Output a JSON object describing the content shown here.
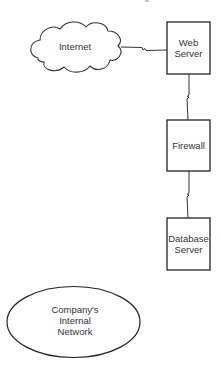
{
  "diagram": {
    "type": "network-topology",
    "stroke_color": "#333333",
    "background": "#ffffff",
    "nodes": [
      {
        "id": "internet",
        "shape": "cloud",
        "label": "Internet",
        "x": 30,
        "y": 22,
        "w": 91,
        "h": 51
      },
      {
        "id": "web_server",
        "shape": "rectangle",
        "label": "Web\nServer",
        "x": 167,
        "y": 22,
        "w": 43,
        "h": 52
      },
      {
        "id": "firewall",
        "shape": "rectangle",
        "label": "Firewall",
        "x": 167,
        "y": 120,
        "w": 43,
        "h": 51
      },
      {
        "id": "database_server",
        "shape": "rectangle",
        "label": "Database\nServer",
        "x": 167,
        "y": 218,
        "w": 43,
        "h": 52
      },
      {
        "id": "internal_network",
        "shape": "ellipse",
        "label": "Company's\nInternal\nNetwork",
        "cx": 73.5,
        "cy": 322,
        "rx": 66.5,
        "ry": 35.5
      }
    ],
    "edges": [
      {
        "from": "internet",
        "to": "web_server",
        "style": "lightning"
      },
      {
        "from": "web_server",
        "to": "firewall",
        "style": "lightning"
      },
      {
        "from": "firewall",
        "to": "database_server",
        "style": "lightning"
      }
    ]
  }
}
